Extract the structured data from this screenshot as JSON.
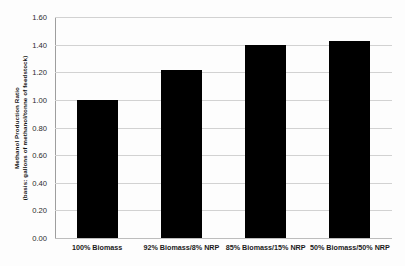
{
  "chart_data": {
    "type": "bar",
    "title": "",
    "subtitle": "",
    "xlabel": "",
    "ylabel_lines": [
      "Methanol Production Ratio",
      "(basis: gallons of methanol/tonne of feedstock)"
    ],
    "categories": [
      "100% Biomass",
      "92% Biomass/8% NRP",
      "85% Biomass/15% NRP",
      "50% Biomass/50% NRP"
    ],
    "values": [
      1.0,
      1.215,
      1.4,
      1.425
    ],
    "ylim": [
      0.0,
      1.6
    ],
    "ytick_values": [
      0.0,
      0.2,
      0.4,
      0.6,
      0.8,
      1.0,
      1.2,
      1.4,
      1.6
    ],
    "ytick_labels": [
      "0.00",
      "0.20",
      "0.40",
      "0.60",
      "0.80",
      "1.00",
      "1.20",
      "1.40",
      "1.60"
    ],
    "grid": true,
    "grid_axis": "y",
    "legend": false,
    "legend_position": "none",
    "bar_color": "#000000",
    "gridline_color": "#d2d2d2",
    "axis_color": "#9e9e9e",
    "background_color": "#fdfdfd"
  }
}
